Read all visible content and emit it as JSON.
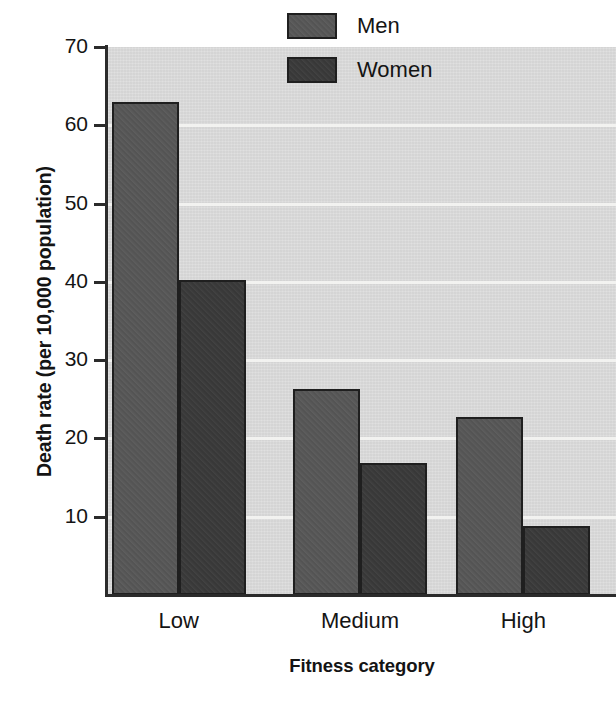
{
  "chart_data": {
    "type": "bar",
    "title": "",
    "subtitle": "",
    "xlabel": "Fitness category",
    "ylabel": "Death rate (per 10,000 population)",
    "categories": [
      "Low",
      "Medium",
      "High"
    ],
    "series": [
      {
        "name": "Men",
        "color": "#575757",
        "values": [
          63.0,
          26.3,
          22.7
        ]
      },
      {
        "name": "Women",
        "color": "#3a3a3a",
        "values": [
          40.2,
          16.8,
          8.8
        ]
      }
    ],
    "ylim": [
      0,
      70
    ],
    "yticks": [
      10,
      20,
      30,
      40,
      50,
      60,
      70
    ],
    "ytick_labels": [
      "10",
      "20",
      "30",
      "40",
      "50",
      "60",
      "70"
    ],
    "grid": true,
    "grid_axis": "y",
    "grid_color": "#f4f4f2",
    "legend_position": "top-right",
    "plot_background": "#d9d9d9",
    "axis_color": "#2b2b2b"
  },
  "axes": {
    "y_title": "Death rate (per 10,000 population)",
    "x_title": "Fitness category"
  },
  "legend": {
    "items": [
      {
        "label": "Men",
        "color": "#575757"
      },
      {
        "label": "Women",
        "color": "#3a3a3a"
      }
    ]
  }
}
